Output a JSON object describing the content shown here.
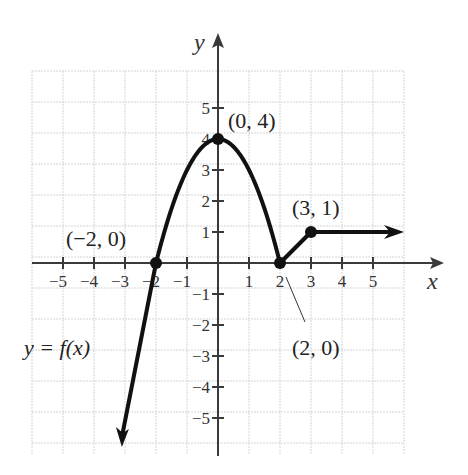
{
  "chart_data": {
    "type": "line",
    "title": "",
    "xlabel": "x",
    "ylabel": "y",
    "xlim": [
      -6,
      6
    ],
    "ylim": [
      -6,
      6
    ],
    "grid": true,
    "x_ticks": [
      -5,
      -4,
      -3,
      -2,
      -1,
      1,
      2,
      3,
      4,
      5
    ],
    "x_tick_labels": [
      "−5",
      "−4",
      "−3",
      "−2",
      "−1",
      "1",
      "2",
      "3",
      "4",
      "5"
    ],
    "y_ticks": [
      5,
      4,
      3,
      2,
      1,
      -1,
      -2,
      -3,
      -4,
      -5
    ],
    "y_tick_labels": [
      "5",
      "4",
      "3",
      "2",
      "1",
      "−1",
      "−2",
      "−3",
      "−4",
      "−5"
    ],
    "series": [
      {
        "name": "y = f(x)",
        "description": "Piecewise function: line rising from lower-left (arrow) to (-2,0), downward parabola y = 4 - x^2 from (-2,0) through vertex (0,4) to (2,0), line segment from (2,0) to (3,1), horizontal ray y = 1 for x >= 3 (arrow to the right)",
        "pieces": [
          {
            "kind": "ray",
            "points": [
              [
                -3.1,
                -6.0
              ],
              [
                -2,
                0
              ]
            ],
            "arrow": "start"
          },
          {
            "kind": "parabola",
            "equation": "y = 4 - x^2",
            "x_range": [
              -2,
              2
            ]
          },
          {
            "kind": "segment",
            "points": [
              [
                2,
                0
              ],
              [
                3,
                1
              ]
            ]
          },
          {
            "kind": "ray",
            "points": [
              [
                3,
                1
              ],
              [
                6,
                1
              ]
            ],
            "arrow": "end"
          }
        ],
        "marked_points": [
          [
            -2,
            0
          ],
          [
            0,
            4
          ],
          [
            2,
            0
          ],
          [
            3,
            1
          ]
        ]
      }
    ],
    "annotations": [
      {
        "text": "(−2, 0)",
        "point": [
          -2,
          0
        ]
      },
      {
        "text": "(0, 4)",
        "point": [
          0,
          4
        ]
      },
      {
        "text": "(2, 0)",
        "point": [
          2,
          0
        ]
      },
      {
        "text": "(3, 1)",
        "point": [
          3,
          1
        ]
      },
      {
        "text": "y = f(x)",
        "label_for": "curve"
      }
    ]
  },
  "labels": {
    "x_axis": "x",
    "y_axis": "y",
    "pt_neg2_0": "(−2, 0)",
    "pt_0_4": "(0, 4)",
    "pt_2_0": "(2, 0)",
    "pt_3_1": "(3, 1)",
    "func": "y = f(x)"
  },
  "colors": {
    "curve": "#111111",
    "grid": "#d4d4d4",
    "axis": "#3a3a3a",
    "background": "#ffffff"
  }
}
